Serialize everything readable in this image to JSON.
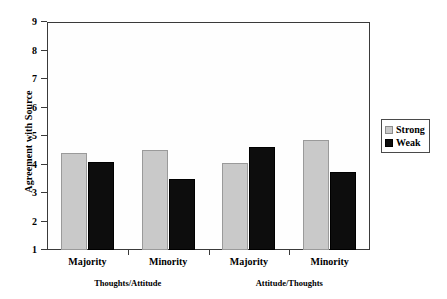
{
  "chart_data": {
    "type": "bar",
    "title": "",
    "xlabel": "",
    "ylabel": "Agreement with Source",
    "ylim": [
      1,
      9
    ],
    "yticks": [
      "1",
      "2",
      "3",
      "4",
      "5",
      "6",
      "7",
      "8",
      "9"
    ],
    "grid": false,
    "legend_position": "right",
    "categories": [
      "Majority",
      "Minority",
      "Majority",
      "Minority"
    ],
    "groups": [
      {
        "label": "Thoughts/Attitude",
        "categories": [
          "Majority",
          "Minority"
        ]
      },
      {
        "label": "Attitude/Thoughts",
        "categories": [
          "Majority",
          "Minority"
        ]
      }
    ],
    "series": [
      {
        "name": "Strong",
        "color": "#c9c9c9",
        "values": [
          4.4,
          4.5,
          4.05,
          4.85
        ]
      },
      {
        "name": "Weak",
        "color": "#0d0d0d",
        "values": [
          4.1,
          3.5,
          4.6,
          3.75
        ]
      }
    ]
  },
  "legend": {
    "items": [
      {
        "label": "Strong",
        "swatch": "strong"
      },
      {
        "label": "Weak",
        "swatch": "weak"
      }
    ]
  }
}
